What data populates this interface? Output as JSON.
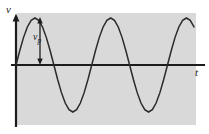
{
  "figure": {
    "panel": {
      "background_color": "#d9d9d9",
      "x": 17,
      "y": 13,
      "width": 179,
      "height": 112
    },
    "axes": {
      "vertical": {
        "label": "v",
        "name": "voltage",
        "x": 16,
        "top": 15,
        "bottom": 127,
        "arrow": "up",
        "color": "#1c1c1c"
      },
      "horizontal": {
        "label": "t",
        "name": "time",
        "y": 65,
        "left": 16,
        "right": 205,
        "color": "#1c1c1c"
      }
    },
    "annotation": {
      "label": "v",
      "subscript": "p",
      "description": "peak amplitude",
      "arrow_type": "double-headed-vertical",
      "x": 40,
      "from_y": 18,
      "to_y": 65
    }
  },
  "chart_data": {
    "type": "line",
    "xlabel": "t",
    "ylabel": "v",
    "grid": false,
    "legend": null,
    "xlim": [
      0,
      2.35
    ],
    "ylim": [
      -1.1,
      1.1
    ],
    "annotations": [
      {
        "text": "v_p",
        "meaning": "peak amplitude",
        "value": 1.0
      }
    ],
    "series": [
      {
        "name": "v(t)",
        "function": "sin(2*pi*t)",
        "amplitude": 1.0,
        "cycles": 2.1,
        "color": "#2b2b2b",
        "x": [
          0.0,
          0.05,
          0.1,
          0.15,
          0.2,
          0.25,
          0.3,
          0.35,
          0.4,
          0.45,
          0.5,
          0.55,
          0.6,
          0.65,
          0.7,
          0.75,
          0.8,
          0.85,
          0.9,
          0.95,
          1.0,
          1.05,
          1.1,
          1.15,
          1.2,
          1.25,
          1.3,
          1.35,
          1.4,
          1.45,
          1.5,
          1.55,
          1.6,
          1.65,
          1.7,
          1.75,
          1.8,
          1.85,
          1.9,
          1.95,
          2.0,
          2.05,
          2.1,
          2.15,
          2.2,
          2.25,
          2.3,
          2.35
        ],
        "y": [
          0.0,
          0.309,
          0.588,
          0.809,
          0.951,
          1.0,
          0.951,
          0.809,
          0.588,
          0.309,
          0.0,
          -0.309,
          -0.588,
          -0.809,
          -0.951,
          -1.0,
          -0.951,
          -0.809,
          -0.588,
          -0.309,
          0.0,
          0.309,
          0.588,
          0.809,
          0.951,
          1.0,
          0.951,
          0.809,
          0.588,
          0.309,
          0.0,
          -0.309,
          -0.588,
          -0.809,
          -0.951,
          -1.0,
          -0.951,
          -0.809,
          -0.588,
          -0.309,
          0.0,
          0.309,
          0.588,
          0.809,
          0.951,
          1.0,
          0.951,
          0.809
        ]
      }
    ]
  }
}
